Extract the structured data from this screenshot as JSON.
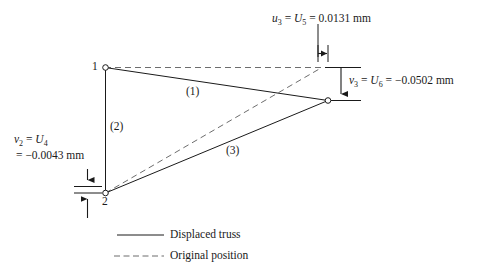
{
  "figure": {
    "type": "truss-displacement-diagram",
    "background_color": "#ffffff",
    "line_color": "#1a1a1a"
  },
  "annotations": {
    "u3": {
      "symbol": "u",
      "symbol_sub": "3",
      "eq1": "=",
      "ref": "U",
      "ref_sub": "5",
      "eq2": "=",
      "value": "0.0131 mm",
      "full_text": "u3 = U5 = 0.0131 mm"
    },
    "v3": {
      "symbol": "v",
      "symbol_sub": "3",
      "eq1": "=",
      "ref": "U",
      "ref_sub": "6",
      "eq2": "=",
      "value": "−0.0502 mm",
      "full_text": "v3 = U6 = −0.0502 mm"
    },
    "v2": {
      "symbol": "v",
      "symbol_sub": "2",
      "eq1": "=",
      "ref": "U",
      "ref_sub": "4",
      "eq2": "=",
      "value": "−0.0043 mm",
      "full_text": "v2 = U4 = −0.0043 mm"
    }
  },
  "nodes": [
    {
      "id": "node-1",
      "label": "1"
    },
    {
      "id": "node-2",
      "label": "2"
    },
    {
      "id": "node-3",
      "label": ""
    }
  ],
  "members": [
    {
      "id": "member-1",
      "label": "(1)"
    },
    {
      "id": "member-2",
      "label": "(2)"
    },
    {
      "id": "member-3",
      "label": "(3)"
    }
  ],
  "legend": {
    "items": [
      {
        "style": "solid",
        "label": "Displaced truss"
      },
      {
        "style": "dashed",
        "label": "Original position"
      }
    ]
  }
}
